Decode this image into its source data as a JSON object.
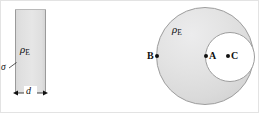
{
  "figure": {
    "background_color": "#ffffff",
    "border_color": "#e3e3e3",
    "fill_color": "#e0e0e0",
    "outline_color": "#9d9d9d",
    "ink_color": "#111111"
  },
  "panels": [
    {
      "id": "slab",
      "name": "charged-slab",
      "shape": "rectangle",
      "labels": {
        "charge_density": "ρ",
        "charge_density_subscript": "E",
        "surface_charge": "σ",
        "thickness": "d"
      }
    },
    {
      "id": "sphere",
      "name": "sphere-with-cavity",
      "shape": "circle-with-circular-cavity",
      "labels": {
        "charge_density": "ρ",
        "charge_density_subscript": "E"
      },
      "points": [
        {
          "id": "A",
          "label": "A",
          "location": "edge of cavity, left side"
        },
        {
          "id": "B",
          "label": "B",
          "location": "left edge of large sphere"
        },
        {
          "id": "C",
          "label": "C",
          "location": "inside cavity, right of A"
        }
      ]
    }
  ]
}
